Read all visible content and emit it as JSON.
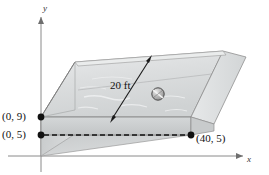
{
  "figure": {
    "background_color": "#ffffff"
  },
  "axes": {
    "x_label": "x",
    "y_label": "y",
    "axis_color": "#8a8a8a",
    "origin_x": 41,
    "origin_y": 156
  },
  "points": [
    {
      "name": "point-0-9",
      "label": "(0, 9)",
      "x": 0,
      "y": 9,
      "px": 41,
      "py": 117
    },
    {
      "name": "point-0-5",
      "label": "(0, 5)",
      "x": 0,
      "y": 5,
      "px": 41,
      "py": 135
    },
    {
      "name": "point-40-5",
      "label": "(40, 5)",
      "x": 40,
      "y": 5,
      "px": 191,
      "py": 135
    }
  ],
  "dimension": {
    "label": "20 ft",
    "arrow_color": "#1a1a1a"
  },
  "ball": {
    "name": "beach-ball",
    "fill": "#b8b8b8",
    "stroke": "#4a4a4a"
  },
  "colors": {
    "water_fill": "#d8dadb",
    "water_fill_light": "#eceeef",
    "box_edge": "#5a5a5a",
    "slope_fill": "#cfd1d2",
    "dash_color": "#111111",
    "dot_color": "#111111"
  }
}
